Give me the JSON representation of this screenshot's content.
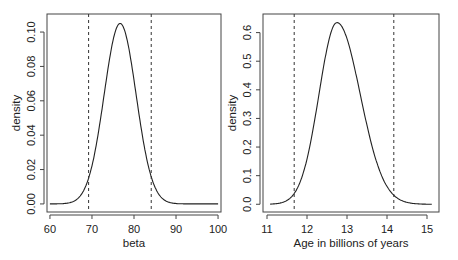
{
  "chart_data": [
    {
      "type": "line",
      "title": "",
      "xlabel": "beta",
      "ylabel": "density",
      "xlim": [
        59.3,
        100.7
      ],
      "ylim": [
        -0.0047,
        0.1105
      ],
      "xticks": [
        60,
        70,
        80,
        90,
        100
      ],
      "yticks": [
        0.0,
        0.02,
        0.04,
        0.06,
        0.08,
        0.1
      ],
      "ytick_labels": [
        "0.00",
        "0.02",
        "0.04",
        "0.06",
        "0.08",
        "0.10"
      ],
      "grid": false,
      "curve": {
        "kind": "normal",
        "mean": 76.7,
        "sd": 3.8,
        "x_from": 60,
        "x_to": 100,
        "peak_density": 0.105
      },
      "vlines": [
        {
          "x": 69.2,
          "style": "dashed"
        },
        {
          "x": 84.1,
          "style": "dashed"
        }
      ],
      "series": [
        {
          "name": "posterior density",
          "x": [
            60,
            65,
            68,
            70,
            72,
            74,
            76,
            76.7,
            78,
            80,
            82,
            84,
            86,
            90,
            95,
            100
          ],
          "values": [
            0.0,
            0.0009,
            0.0077,
            0.0221,
            0.0489,
            0.0842,
            0.1037,
            0.105,
            0.1002,
            0.0719,
            0.0396,
            0.0166,
            0.0053,
            0.0003,
            0.0,
            0.0
          ]
        }
      ]
    },
    {
      "type": "line",
      "title": "",
      "xlabel": "Age in billions of years",
      "ylabel": "density",
      "xlim": [
        10.9,
        15.3
      ],
      "ylim": [
        -0.027,
        0.665
      ],
      "xticks": [
        11,
        12,
        13,
        14,
        15
      ],
      "yticks": [
        0.0,
        0.1,
        0.2,
        0.3,
        0.4,
        0.5,
        0.6
      ],
      "ytick_labels": [
        "0.0",
        "0.1",
        "0.2",
        "0.3",
        "0.4",
        "0.5",
        "0.6"
      ],
      "grid": false,
      "curve": {
        "kind": "skewed",
        "mode": 12.75,
        "x_from": 11.08,
        "x_to": 15.12,
        "peak_density": 0.635
      },
      "vlines": [
        {
          "x": 11.68,
          "style": "dashed"
        },
        {
          "x": 14.17,
          "style": "dashed"
        }
      ],
      "series": [
        {
          "name": "age density",
          "x": [
            11.08,
            11.3,
            11.5,
            11.68,
            12.0,
            12.25,
            12.5,
            12.75,
            13.0,
            13.25,
            13.5,
            13.75,
            14.0,
            14.17,
            14.5,
            14.8,
            15.12
          ],
          "values": [
            0.01,
            0.03,
            0.065,
            0.11,
            0.26,
            0.42,
            0.57,
            0.635,
            0.59,
            0.47,
            0.33,
            0.2,
            0.11,
            0.075,
            0.035,
            0.015,
            0.005
          ]
        }
      ]
    }
  ]
}
